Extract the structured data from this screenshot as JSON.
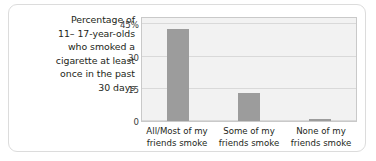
{
  "figure": {
    "caption_lines": [
      "Percentage of",
      "11– 17-year-olds",
      "who smoked a",
      "cigarette at least",
      "once in the past",
      "30 days"
    ]
  },
  "colors": {
    "bar": "#9c9c9c",
    "plot_background": "#f2f2f2",
    "gridline": "#d9d9d9",
    "plot_border": "#c9c9c9",
    "card_border": "#dcdcdc",
    "text": "#231f20"
  },
  "chart_data": {
    "type": "bar",
    "title": "Percentage of 11– 17-year-olds who smoked a cigarette at least once in the past 30 days",
    "xlabel": "",
    "ylabel": "Percentage of 11– 17-year-olds who smoked a cigarette at least once in the past 30 days",
    "categories": [
      "All/Most of my friends smoke",
      "Some of my friends smoke",
      "None of my friends smoke"
    ],
    "category_lines": [
      [
        "All/Most of my",
        "friends smoke"
      ],
      [
        "Some of my",
        "friends smoke"
      ],
      [
        "None of my",
        "friends smoke"
      ]
    ],
    "values": [
      43,
      13,
      1
    ],
    "ylim": [
      0,
      48
    ],
    "yticks": [
      0,
      15,
      30,
      45
    ],
    "ytick_labels": [
      "0",
      "15",
      "30",
      "45%"
    ],
    "grid": true,
    "legend": false
  }
}
